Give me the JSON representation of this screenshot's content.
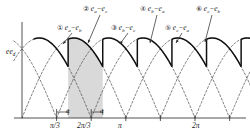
{
  "figure": {
    "y_axis_label": "e_d",
    "shaded_label": "shaded conduction interval"
  },
  "callouts": [
    {
      "num": "①",
      "text": "e",
      "sub1": "a",
      "sub2": "b",
      "expr": "e_a − e_b"
    },
    {
      "num": "②",
      "text": "e",
      "sub1": "a",
      "sub2": "c",
      "expr": "e_a − e_c"
    },
    {
      "num": "③",
      "text": "e",
      "sub1": "b",
      "sub2": "c",
      "expr": "e_b − e_c"
    },
    {
      "num": "④",
      "text": "e",
      "sub1": "b",
      "sub2": "a",
      "expr": "e_b − e_a"
    },
    {
      "num": "⑤",
      "text": "e",
      "sub1": "c",
      "sub2": "a",
      "expr": "e_c − e_a"
    },
    {
      "num": "⑥",
      "text": "e",
      "sub1": "c",
      "sub2": "b",
      "expr": "e_c − e_b"
    }
  ],
  "axis": {
    "xticks": [
      {
        "label": "π/3",
        "x": 62
      },
      {
        "label": "2π/3",
        "x": 94
      },
      {
        "label": "π",
        "x": 130
      },
      {
        "label": "2π",
        "x": 205
      }
    ],
    "alpha_markers": [
      {
        "label": "α",
        "x": 70
      },
      {
        "label": "α",
        "x": 104
      }
    ]
  },
  "chart_data": {
    "type": "line",
    "title": "",
    "xlabel": "",
    "ylabel": "e_d",
    "xlim": [
      0,
      7.33
    ],
    "ylim": [
      0,
      1.1
    ],
    "xtick_values": [
      1.0472,
      2.0944,
      3.1416,
      6.2832
    ],
    "xtick_labels": [
      "π/3",
      "2π/3",
      "π",
      "2π"
    ],
    "grid": false,
    "legend": "none",
    "annotations": [
      "① e_a − e_b",
      "② e_a − e_c",
      "③ e_b − e_c",
      "④ e_b − e_a",
      "⑤ e_c − e_a",
      "⑥ e_c − e_b",
      "α",
      "α"
    ],
    "series": [
      {
        "name": "e_a - e_b",
        "phase_deg": 0,
        "order": 1
      },
      {
        "name": "e_a - e_c",
        "phase_deg": 60,
        "order": 2
      },
      {
        "name": "e_b - e_c",
        "phase_deg": 120,
        "order": 3
      },
      {
        "name": "e_b - e_a",
        "phase_deg": 180,
        "order": 4
      },
      {
        "name": "e_c - e_a",
        "phase_deg": 240,
        "order": 5
      },
      {
        "name": "e_c - e_b",
        "phase_deg": 300,
        "order": 6
      }
    ],
    "firing_angle_alpha_deg": 20,
    "pulse_width_deg": 60,
    "peak_value": 1.0
  }
}
